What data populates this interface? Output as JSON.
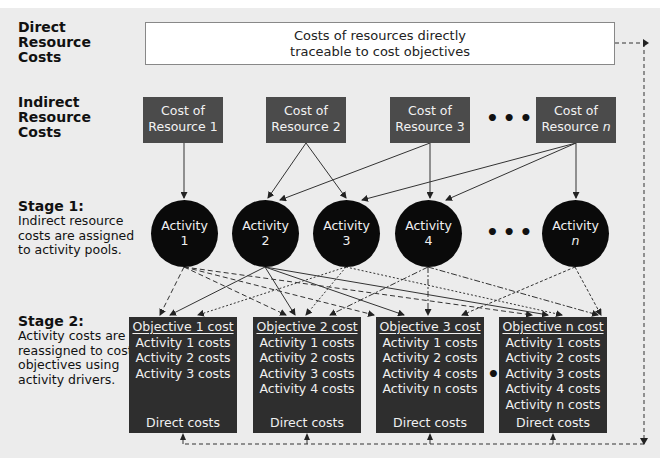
{
  "rows": {
    "direct": {
      "label": [
        "Direct",
        "Resource",
        "Costs"
      ]
    },
    "indirect": {
      "label": [
        "Indirect",
        "Resource",
        "Costs"
      ]
    },
    "stage1": {
      "title": "Stage 1:",
      "description": [
        "Indirect resource",
        "costs are assigned",
        "to activity pools."
      ]
    },
    "stage2": {
      "title": "Stage 2:",
      "description": [
        "Activity costs are",
        "reassigned to cost",
        "objectives using",
        "activity drivers."
      ]
    }
  },
  "direct_box": {
    "lines": [
      "Costs of resources directly",
      "traceable to cost objectives"
    ]
  },
  "resources": [
    {
      "line1": "Cost of",
      "line2": "Resource 1"
    },
    {
      "line1": "Cost of",
      "line2": "Resource 2"
    },
    {
      "line1": "Cost of",
      "line2": "Resource 3"
    },
    {
      "line1": "Cost of",
      "line2": "Resource",
      "italic_suffix": "n"
    }
  ],
  "activities": [
    {
      "label": "Activity",
      "index": "1"
    },
    {
      "label": "Activity",
      "index": "2"
    },
    {
      "label": "Activity",
      "index": "3"
    },
    {
      "label": "Activity",
      "index": "4"
    },
    {
      "label": "Activity",
      "index": "n"
    }
  ],
  "objectives": [
    {
      "title": "Objective 1 cost",
      "items": [
        "Activity 1 costs",
        "Activity 2 costs",
        "Activity 3 costs"
      ],
      "direct": "Direct costs"
    },
    {
      "title": "Objective 2 cost",
      "items": [
        "Activity 1 costs",
        "Activity 2 costs",
        "Activity 3 costs",
        "Activity 4 costs"
      ],
      "direct": "Direct costs"
    },
    {
      "title": "Objective 3 cost",
      "items": [
        "Activity 1 costs",
        "Activity 2 costs",
        "Activity 4 costs",
        "Activity n costs"
      ],
      "direct": "Direct costs"
    },
    {
      "title": "Objective n cost",
      "items": [
        "Activity 1 costs",
        "Activity 2 costs",
        "Activity 3 costs",
        "Activity 4 costs",
        "Activity n costs"
      ],
      "direct": "Direct costs"
    }
  ],
  "ellipsis": "•••",
  "colors": {
    "background": "#ececec",
    "resource_box": "#4b4b4b",
    "activity_circle": "#0a0a0a",
    "objective_box": "#2e2e2e",
    "line": "#333333"
  }
}
